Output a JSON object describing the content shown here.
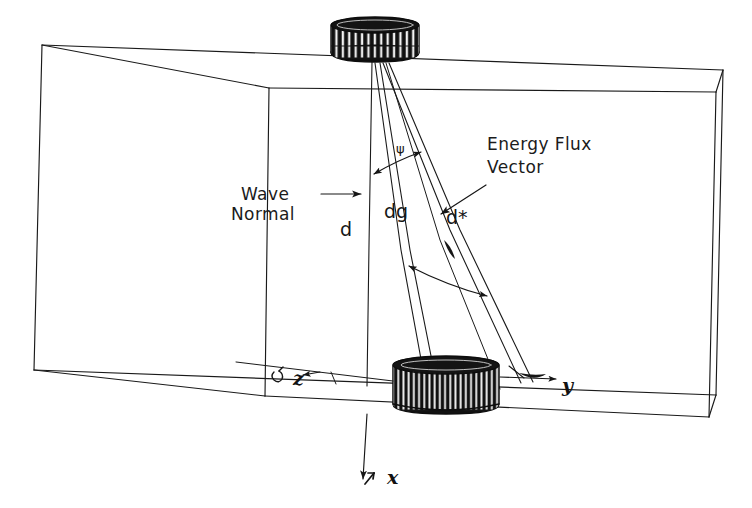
{
  "figure": {
    "name": "wave-normal-energy-flux-vector-diagram",
    "background_color": "#ffffff",
    "ink_color": "#1a1a1a"
  },
  "labels": {
    "wave_normal_line1": "Wave",
    "wave_normal_line2": "Normal",
    "energy_flux_line1": "Energy  Flux",
    "energy_flux_line2": "Vector",
    "d": "d",
    "dg": "dg",
    "d_star": "d*",
    "psi": "ψ"
  },
  "axes": [
    {
      "name": "z-axis",
      "label": "z",
      "marker": "↙"
    },
    {
      "name": "y-axis",
      "label": "y",
      "marker": ""
    },
    {
      "name": "x-axis",
      "label": "x",
      "marker": "↓"
    }
  ],
  "components": [
    {
      "name": "top-transducer",
      "kind": "striated-cylinder",
      "position": "top-face"
    },
    {
      "name": "bottom-transducer",
      "kind": "striated-cylinder",
      "position": "bottom-face"
    },
    {
      "name": "sample-box",
      "kind": "parallelepiped-wireframe"
    }
  ],
  "annotations": {
    "psi_arc": "double-headed arc between wave normal and energy flux vector",
    "lower_arc": "double-headed arc between dg and d* near the bottom",
    "wave_normal_pointer": "arrow pointing right to the d ray",
    "energy_flux_pointer": "leader line pointing down-left to the energy flux ray"
  }
}
